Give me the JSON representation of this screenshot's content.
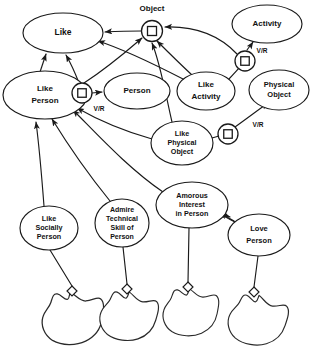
{
  "diagram": {
    "background_color": "#ffffff",
    "line_color": "#1a1a1a",
    "nodes": [
      {
        "id": "like",
        "label": "Like",
        "lines": [
          "Like"
        ],
        "cx": 63,
        "cy": 33,
        "rx": 40,
        "ry": 20,
        "font_size": 8.5
      },
      {
        "id": "object",
        "label": "Object",
        "lines": [
          "Object"
        ],
        "cx": 152,
        "cy": 9,
        "rx": 0,
        "ry": 0,
        "font_size": 8.0
      },
      {
        "id": "activity",
        "label": "Activity",
        "lines": [
          "Activity"
        ],
        "cx": 267,
        "cy": 24,
        "rx": 35,
        "ry": 19,
        "font_size": 8.0
      },
      {
        "id": "like-person",
        "label": "Like Person",
        "lines": [
          "Like",
          "Person"
        ],
        "cx": 45,
        "cy": 95,
        "rx": 42,
        "ry": 24,
        "font_size": 8.0
      },
      {
        "id": "person",
        "label": "Person",
        "lines": [
          "Person"
        ],
        "cx": 137,
        "cy": 91,
        "rx": 33,
        "ry": 18,
        "font_size": 8.0
      },
      {
        "id": "like-activity",
        "label": "Like Activity",
        "lines": [
          "Like",
          "Activity"
        ],
        "cx": 206,
        "cy": 91,
        "rx": 29,
        "ry": 19,
        "font_size": 8.0
      },
      {
        "id": "physical-object",
        "label": "Physical Object",
        "lines": [
          "Physical",
          "Object"
        ],
        "cx": 279,
        "cy": 90,
        "rx": 30,
        "ry": 20,
        "font_size": 7.5
      },
      {
        "id": "like-physical-object",
        "label": "Like Physical Object",
        "lines": [
          "Like",
          "Physical",
          "Object"
        ],
        "cx": 182,
        "cy": 143,
        "rx": 31,
        "ry": 22,
        "font_size": 7.2
      },
      {
        "id": "amorous-interest-in-person",
        "label": "Amorous Interest in Person",
        "lines": [
          "Amorous",
          "Interest",
          "in Person"
        ],
        "cx": 192,
        "cy": 205,
        "rx": 36,
        "ry": 23,
        "font_size": 7.2
      },
      {
        "id": "like-socially-person",
        "label": "Like Socially Person",
        "lines": [
          "Like",
          "Socially",
          "Person"
        ],
        "cx": 49,
        "cy": 228,
        "rx": 29,
        "ry": 22,
        "font_size": 7.2
      },
      {
        "id": "admire-technical-skill-of-person",
        "label": "Admire Technical Skill of Person",
        "lines": [
          "Admire",
          "Technical",
          "Skill of",
          "Person"
        ],
        "cx": 122,
        "cy": 223,
        "rx": 27,
        "ry": 24,
        "font_size": 7.0
      },
      {
        "id": "love-person",
        "label": "Love Person",
        "lines": [
          "Love",
          "Person"
        ],
        "cx": 259,
        "cy": 235,
        "rx": 31,
        "ry": 21,
        "font_size": 7.5
      }
    ],
    "connectors": [
      {
        "id": "connector-object",
        "cx": 152,
        "cy": 31,
        "r": 10.5,
        "square": 9,
        "label": ""
      },
      {
        "id": "connector-like-person-vr",
        "cx": 82,
        "cy": 93,
        "r": 10.0,
        "square": 8.5,
        "label": "V/R"
      },
      {
        "id": "connector-activity-vr",
        "cx": 245,
        "cy": 61,
        "r": 10.0,
        "square": 8.5,
        "label": "V/R"
      },
      {
        "id": "connector-physical-vr",
        "cx": 228,
        "cy": 134,
        "r": 10.0,
        "square": 8.5,
        "label": "V/R"
      }
    ],
    "connector_labels": [
      {
        "id": "vr-label-person",
        "text": "V/R",
        "x": 99,
        "y": 109,
        "font_size": 6.5
      },
      {
        "id": "vr-label-activity",
        "text": "V/R",
        "x": 262,
        "y": 51,
        "font_size": 6.5
      },
      {
        "id": "vr-label-physical",
        "text": "V/R",
        "x": 258,
        "y": 125,
        "font_size": 6.5
      }
    ],
    "instance_blobs": [
      {
        "id": "instance-blob-1",
        "cx": 72,
        "cy": 318,
        "scale": 1.0,
        "rotate": -4
      },
      {
        "id": "instance-blob-2",
        "cx": 128,
        "cy": 316,
        "scale": 0.93,
        "rotate": 3
      },
      {
        "id": "instance-blob-3",
        "cx": 190,
        "cy": 312,
        "scale": 0.9,
        "rotate": -2
      },
      {
        "id": "instance-blob-4",
        "cx": 257,
        "cy": 320,
        "scale": 0.95,
        "rotate": 5
      }
    ],
    "diamonds": [
      {
        "id": "diamond-1",
        "cx": 72,
        "cy": 291,
        "size": 5
      },
      {
        "id": "diamond-2",
        "cx": 127,
        "cy": 289,
        "size": 5
      },
      {
        "id": "diamond-3",
        "cx": 188,
        "cy": 287,
        "size": 5
      },
      {
        "id": "diamond-4",
        "cx": 254,
        "cy": 292,
        "size": 5
      }
    ],
    "edges": [
      {
        "id": "edge-object-to-like",
        "from": "connector-object",
        "to": "like",
        "arrow": true
      },
      {
        "id": "edge-connector-lp-to-like",
        "from": "connector-like-person-vr",
        "to": "like",
        "arrow": true
      },
      {
        "id": "edge-connector-lp-to-person",
        "from": "connector-like-person-vr",
        "to": "person",
        "arrow": true,
        "label": "V/R"
      },
      {
        "id": "edge-like-person-to-connector",
        "from": "like-person",
        "to": "connector-like-person-vr",
        "arrow": false
      },
      {
        "id": "edge-like-person-to-like",
        "from": "like-person",
        "to": "like",
        "arrow": true
      },
      {
        "id": "edge-like-person-to-object",
        "from": "like-person",
        "to": "connector-object",
        "arrow": true
      },
      {
        "id": "edge-like-activity-to-like",
        "from": "like-activity",
        "to": "like",
        "arrow": true
      },
      {
        "id": "edge-like-activity-to-object",
        "from": "like-activity",
        "to": "connector-object",
        "arrow": true
      },
      {
        "id": "edge-like-activity-to-connector-activity",
        "from": "like-activity",
        "to": "connector-activity-vr",
        "arrow": false
      },
      {
        "id": "edge-connector-activity-to-activity",
        "from": "connector-activity-vr",
        "to": "activity",
        "arrow": true,
        "label": "V/R"
      },
      {
        "id": "edge-connector-activity-to-object",
        "from": "connector-activity-vr",
        "to": "connector-object",
        "arrow": true
      },
      {
        "id": "edge-like-physical-object-to-object",
        "from": "like-physical-object",
        "to": "connector-object",
        "arrow": true
      },
      {
        "id": "edge-like-physical-object-to-like-person",
        "from": "like-physical-object",
        "to": "like-person",
        "arrow": true
      },
      {
        "id": "edge-like-physical-object-to-connector-physical",
        "from": "like-physical-object",
        "to": "connector-physical-vr",
        "arrow": false
      },
      {
        "id": "edge-connector-physical-to-physical-object",
        "from": "connector-physical-vr",
        "to": "physical-object",
        "arrow": true,
        "label": "V/R"
      },
      {
        "id": "edge-amorous-to-like-person",
        "from": "amorous-interest-in-person",
        "to": "like-person",
        "arrow": true
      },
      {
        "id": "edge-like-socially-to-like-person",
        "from": "like-socially-person",
        "to": "like-person",
        "arrow": true
      },
      {
        "id": "edge-admire-to-like-person",
        "from": "admire-technical-skill-of-person",
        "to": "like-person",
        "arrow": true
      },
      {
        "id": "edge-love-person-to-amorous",
        "from": "love-person",
        "to": "amorous-interest-in-person",
        "arrow": true
      },
      {
        "id": "edge-like-socially-to-instance",
        "from": "like-socially-person",
        "to": "instance-blob-1",
        "arrow": false
      },
      {
        "id": "edge-admire-to-instance",
        "from": "admire-technical-skill-of-person",
        "to": "instance-blob-2",
        "arrow": false
      },
      {
        "id": "edge-amorous-to-instance",
        "from": "amorous-interest-in-person",
        "to": "instance-blob-3",
        "arrow": false
      },
      {
        "id": "edge-love-person-to-instance",
        "from": "love-person",
        "to": "instance-blob-4",
        "arrow": false
      }
    ]
  }
}
